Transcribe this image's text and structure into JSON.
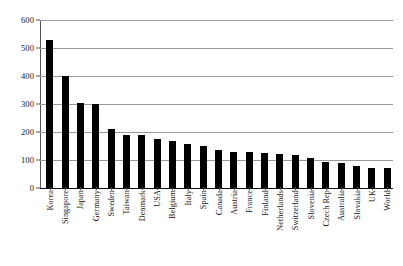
{
  "chart_data": {
    "type": "bar",
    "title": "",
    "subtitle": "",
    "xlabel": "",
    "ylabel": "",
    "ylim": [
      0,
      600
    ],
    "ytick_labels": [
      "0",
      "100",
      "200",
      "300",
      "400",
      "500",
      "600"
    ],
    "ytick_values": [
      0,
      100,
      200,
      300,
      400,
      500,
      600
    ],
    "grid": true,
    "legend": null,
    "bar_color": "#000000",
    "gridline_color": "#9a9a9a",
    "axis_color": "#555555",
    "categories": [
      "Korea",
      "Singapore",
      "Japan",
      "Germany",
      "Sweden",
      "Taiwan",
      "Denmark",
      "USA",
      "Belgium",
      "Italy",
      "Spain",
      "Canada",
      "Austria",
      "France",
      "Finland",
      "Netherlands",
      "Switzerland",
      "Slovenia",
      "Czech Rep",
      "Australia",
      "Slovakia",
      "UK",
      "World"
    ],
    "values": [
      530,
      400,
      305,
      300,
      210,
      190,
      188,
      175,
      168,
      158,
      150,
      135,
      128,
      127,
      126,
      120,
      119,
      108,
      94,
      88,
      80,
      73,
      71
    ]
  }
}
